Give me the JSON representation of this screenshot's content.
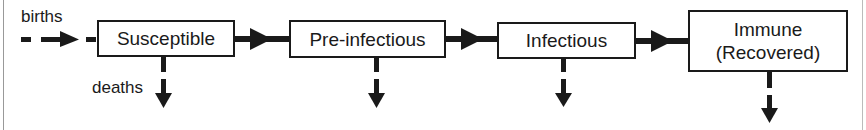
{
  "diagram": {
    "compartments": [
      {
        "id": "susceptible",
        "label": "Susceptible"
      },
      {
        "id": "pre-infectious",
        "label": "Pre-infectious"
      },
      {
        "id": "infectious",
        "label": "Infectious"
      },
      {
        "id": "immune",
        "label_line1": "Immune",
        "label_line2": "(Recovered)"
      }
    ],
    "labels": {
      "births": "births",
      "deaths": "deaths"
    },
    "colors": {
      "stroke": "#1a1a1a",
      "background": "#ffffff",
      "frame": "#999999"
    }
  }
}
